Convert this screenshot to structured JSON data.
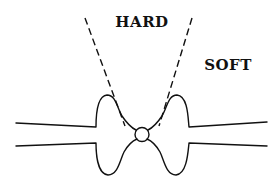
{
  "diagram": {
    "labels": {
      "hard": "HARD",
      "soft": "SOFT"
    },
    "elements": [
      "upper-tube-outline",
      "lower-tube-outline",
      "central-vertex-circle",
      "left-dashed-line",
      "right-dashed-line"
    ],
    "colors": {
      "stroke": "#111111",
      "background": "#ffffff"
    }
  }
}
